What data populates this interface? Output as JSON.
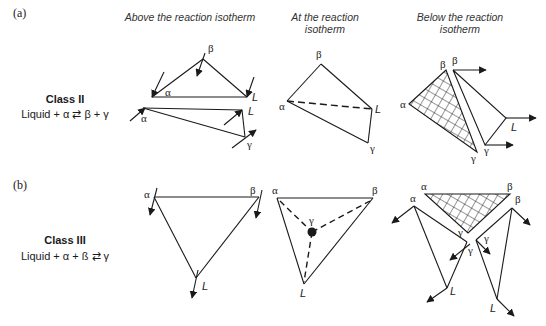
{
  "panels": [
    {
      "id": "a",
      "label": "(a)",
      "class_title": "Class II",
      "reaction": "Liquid + α ⇄ β + γ"
    },
    {
      "id": "b",
      "label": "(b)",
      "class_title": "Class III",
      "reaction": "Liquid + α + ß ⇄  γ"
    }
  ],
  "column_headers": [
    {
      "line1": "Above the reaction isotherm",
      "line2": ""
    },
    {
      "line1": "At the reaction",
      "line2": "isotherm"
    },
    {
      "line1": "Below the reaction",
      "line2": "isotherm"
    }
  ],
  "phase_labels": {
    "alpha": "α",
    "beta": "β",
    "gamma": "γ",
    "liquid": "L"
  },
  "colors": {
    "line": "#1a1a1a",
    "background": "#ffffff"
  }
}
